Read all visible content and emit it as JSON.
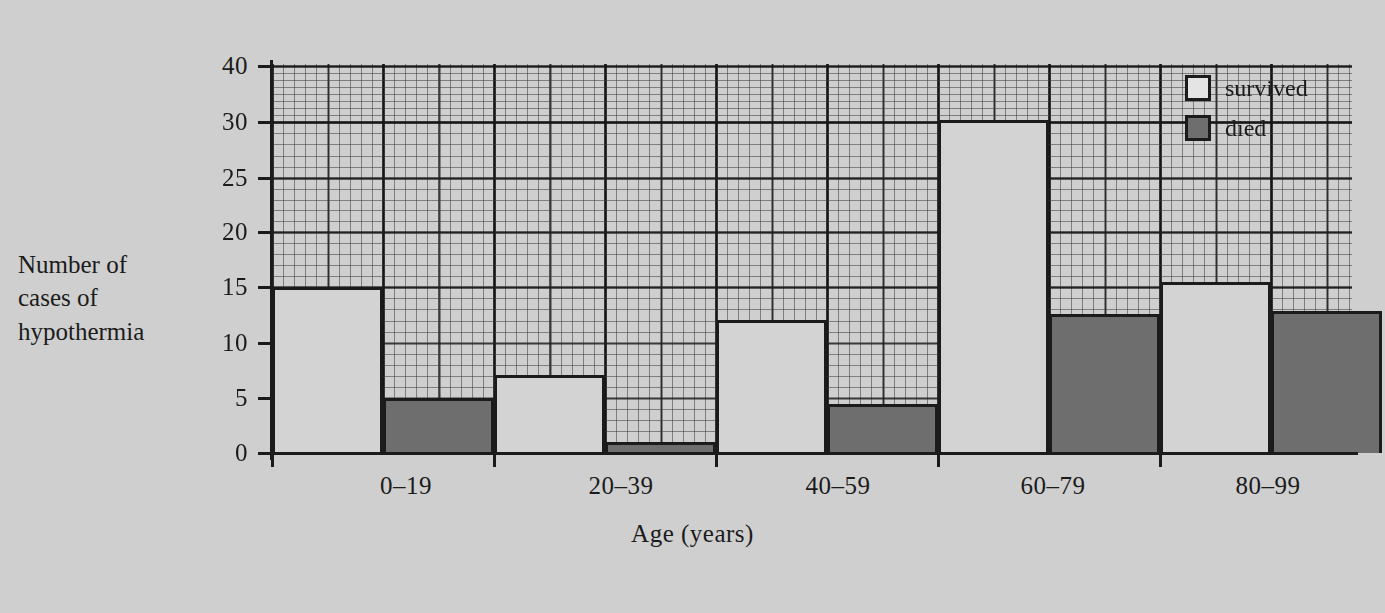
{
  "chart_data": {
    "type": "bar",
    "title": "",
    "xlabel": "Age (years)",
    "ylabel": "Number of cases of hypothermia",
    "ylabel_lines": [
      "Number of",
      "cases of",
      "hypothermia"
    ],
    "categories": [
      "0–19",
      "20–39",
      "40–59",
      "60–79",
      "80–99"
    ],
    "series": [
      {
        "name": "survived",
        "color": "#d3d3d3",
        "values": [
          15,
          7,
          12,
          31,
          16
        ]
      },
      {
        "name": "died",
        "color": "#6e6e6e",
        "values": [
          5,
          1,
          4.5,
          12.5,
          12.7
        ]
      }
    ],
    "ylim": [
      0,
      40
    ],
    "ytick_labels": [
      "0",
      "5",
      "10",
      "15",
      "20",
      "25",
      "30",
      "40"
    ],
    "ytick_values": [
      0,
      5,
      10,
      15,
      20,
      25,
      30,
      40
    ],
    "grid": true,
    "grid_note": "fine graph-paper grid behind bars; y-axis compressed between 30 and 40",
    "legend_position": "top-right",
    "legend": [
      {
        "label": "survived",
        "swatch": "white-square"
      },
      {
        "label": "died",
        "swatch": "dark-gray-square"
      }
    ]
  },
  "axes": {
    "yticks": [
      {
        "label": "40",
        "y": 66
      },
      {
        "label": "30",
        "y": 122
      },
      {
        "label": "25",
        "y": 178
      },
      {
        "label": "20",
        "y": 232
      },
      {
        "label": "15",
        "y": 287
      },
      {
        "label": "10",
        "y": 343
      },
      {
        "label": "5",
        "y": 398
      },
      {
        "label": "0",
        "y": 453
      }
    ],
    "xticks": [
      {
        "label": "0–19",
        "center": 406
      },
      {
        "label": "20–39",
        "center": 621
      },
      {
        "label": "40–59",
        "center": 838
      },
      {
        "label": "60–79",
        "center": 1053
      },
      {
        "label": "80–99",
        "center": 1268
      }
    ]
  },
  "bars": [
    {
      "group": "0–19",
      "series": "survived",
      "value": 15,
      "x": 272,
      "w": 111,
      "top": 287
    },
    {
      "group": "0–19",
      "series": "died",
      "value": 5,
      "x": 383,
      "w": 111,
      "top": 398
    },
    {
      "group": "20–39",
      "series": "survived",
      "value": 7,
      "x": 494,
      "w": 111,
      "top": 375
    },
    {
      "group": "20–39",
      "series": "died",
      "value": 1,
      "x": 605,
      "w": 111,
      "top": 442
    },
    {
      "group": "40–59",
      "series": "survived",
      "value": 12,
      "x": 716,
      "w": 111,
      "top": 320
    },
    {
      "group": "40–59",
      "series": "died",
      "value": 4.5,
      "x": 827,
      "w": 111,
      "top": 404
    },
    {
      "group": "60–79",
      "series": "survived",
      "value": 31,
      "x": 938,
      "w": 111,
      "top": 120
    },
    {
      "group": "60–79",
      "series": "died",
      "value": 12.5,
      "x": 1049,
      "w": 111,
      "top": 314
    },
    {
      "group": "80–79",
      "series": "survived",
      "value": 16,
      "x": 1160,
      "w": 111,
      "top": 282
    },
    {
      "group": "80–99",
      "series": "died",
      "value": 12.7,
      "x": 1271,
      "w": 111,
      "top": 311
    }
  ],
  "colors": {
    "background": "#cfcfcf",
    "ink": "#1b1b1b",
    "survived_fill": "#d3d3d3",
    "died_fill": "#6e6e6e",
    "grid_minor": "#8c8c8c",
    "grid_major": "#4a4a4a"
  }
}
